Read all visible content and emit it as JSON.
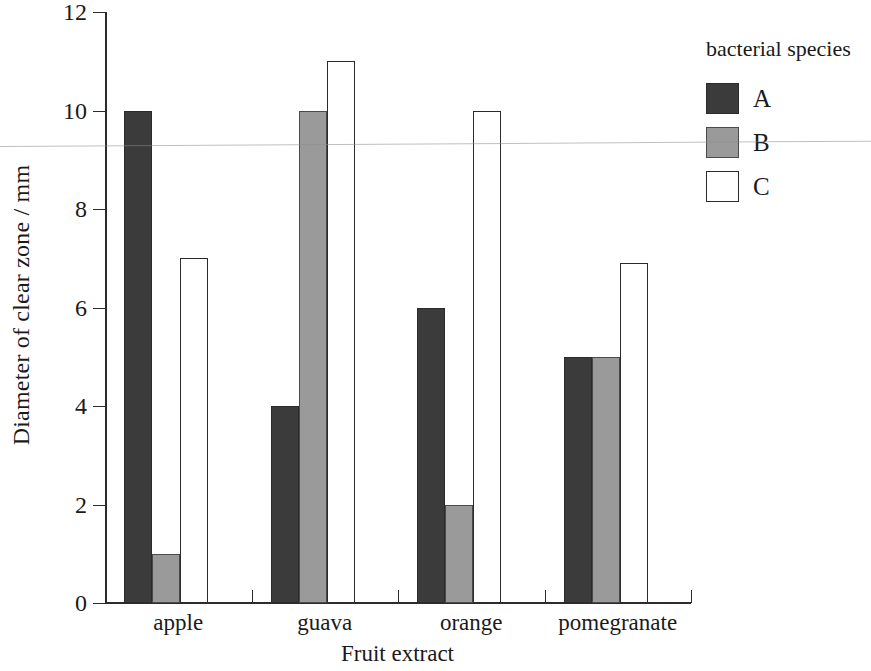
{
  "chart_data": {
    "type": "bar",
    "title": "",
    "xlabel": "Fruit extract",
    "ylabel": "Diameter of clear zone / mm",
    "categories": [
      "apple",
      "guava",
      "orange",
      "pomegranate"
    ],
    "ylim": [
      0,
      12
    ],
    "yticks": [
      0,
      2,
      4,
      6,
      8,
      10,
      12
    ],
    "ytick_labels": [
      "0",
      "2",
      "4",
      "6",
      "8",
      "10",
      "12"
    ],
    "grid": false,
    "legend_position": "right",
    "legend_title": "bacterial species",
    "series": [
      {
        "name": "A",
        "color": "#3b3b3b",
        "values": [
          10,
          4,
          6,
          5
        ]
      },
      {
        "name": "B",
        "color": "#9a9a9a",
        "values": [
          1,
          10,
          2,
          5
        ]
      },
      {
        "name": "C",
        "color": "#ffffff",
        "values": [
          7,
          11,
          10,
          6.9
        ]
      }
    ]
  },
  "axes": {
    "y": {
      "label": "Diameter of clear zone / mm",
      "ticks": [
        {
          "value": 12,
          "label": "12"
        },
        {
          "value": 10,
          "label": "10"
        },
        {
          "value": 8,
          "label": "8"
        },
        {
          "value": 6,
          "label": "6"
        },
        {
          "value": 4,
          "label": "4"
        },
        {
          "value": 2,
          "label": "2"
        },
        {
          "value": 0,
          "label": "0"
        }
      ]
    },
    "x": {
      "label": "Fruit extract",
      "categories": [
        {
          "label": "apple"
        },
        {
          "label": "guava"
        },
        {
          "label": "orange"
        },
        {
          "label": "pomegranate"
        }
      ]
    }
  },
  "legend": {
    "title": "bacterial species",
    "entries": [
      {
        "label": "A",
        "color": "#3b3b3b"
      },
      {
        "label": "B",
        "color": "#9a9a9a"
      },
      {
        "label": "C",
        "color": "#ffffff"
      }
    ]
  }
}
